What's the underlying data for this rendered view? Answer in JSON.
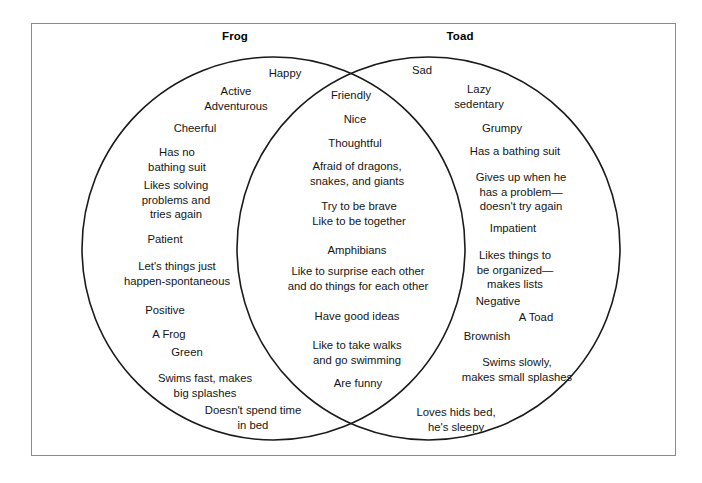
{
  "diagram": {
    "type": "venn-2-set",
    "left_circle": {
      "title": "Frog",
      "entries": [
        "Happy",
        "Active\nAdventurous",
        "Cheerful",
        "Has no\nbathing suit",
        "Likes solving\nproblems and\ntries again",
        "Patient",
        "Let's things just\nhappen-spontaneous",
        "Positive",
        "A Frog",
        "Green",
        "Swims fast, makes\nbig splashes",
        "Doesn't spend time\nin bed"
      ]
    },
    "right_circle": {
      "title": "Toad",
      "entries": [
        "Sad",
        "Lazy\nsedentary",
        "Grumpy",
        "Has a bathing suit",
        "Gives up when he\nhas a problem—\ndoesn't try again",
        "Impatient",
        "Likes things to\nbe organized—\nmakes lists",
        "Negative",
        "A Toad",
        "Brownish",
        "Swims slowly,\nmakes small splashes",
        "Loves hids bed,\nhe's sleepy"
      ]
    },
    "overlap": {
      "entries": [
        "Friendly",
        "Nice",
        "Thoughtful",
        "Afraid of dragons,\nsnakes, and giants",
        "Try to be brave\nLike to be together",
        "Amphibians",
        "Like to surprise each other\nand do things for each other",
        "Have good ideas",
        "Like to take walks\nand go swimming",
        "Are funny"
      ]
    },
    "colors": {
      "stroke": "#1a1a1a",
      "frame": "#8a8a8a",
      "background": "#ffffff",
      "text": "#151515"
    }
  }
}
